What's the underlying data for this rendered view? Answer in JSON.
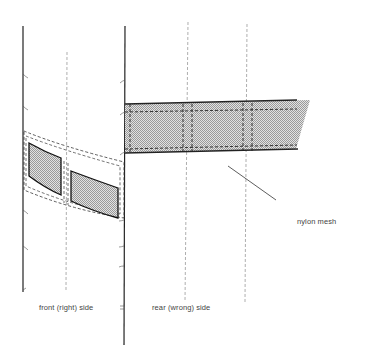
{
  "diagram": {
    "labels": {
      "front_side": "front (right) side",
      "rear_side": "rear (wrong) side",
      "mesh": "nylon mesh"
    },
    "colors": {
      "line": "#222222",
      "dashed": "#666666",
      "fill": "#c9c9c9",
      "text": "#444444"
    }
  }
}
